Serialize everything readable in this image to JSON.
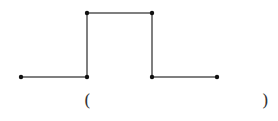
{
  "diagram": {
    "type": "step-path",
    "stroke_color": "#555555",
    "point_color": "#111111",
    "points": [
      {
        "x": 21,
        "y": 77
      },
      {
        "x": 87,
        "y": 77
      },
      {
        "x": 87,
        "y": 13
      },
      {
        "x": 152,
        "y": 13
      },
      {
        "x": 152,
        "y": 77
      },
      {
        "x": 217,
        "y": 77
      }
    ]
  },
  "answer": {
    "open_paren": "(",
    "close_paren": ")",
    "blank": ""
  }
}
